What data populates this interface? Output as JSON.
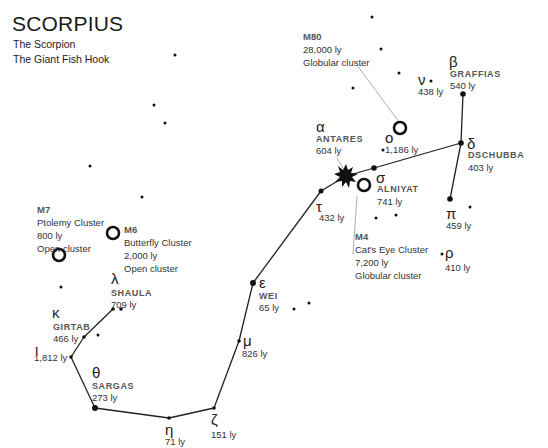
{
  "header": {
    "title": "SCORPIUS",
    "subtitle1": "The Scorpion",
    "subtitle2": "The Giant Fish Hook"
  },
  "stars": {
    "antares": {
      "greek": "α",
      "name": "ANTARES",
      "dist": "604 ly"
    },
    "graffias": {
      "greek": "β",
      "name": "GRAFFIAS",
      "dist": "540 ly"
    },
    "dschubba": {
      "greek": "δ",
      "name": "DSCHUBBA",
      "dist": "403 ly"
    },
    "alniyat": {
      "greek": "σ",
      "name": "ALNIYAT",
      "dist": "741 ly"
    },
    "pi": {
      "greek": "π",
      "dist": "459 ly"
    },
    "rho": {
      "greek": "ρ",
      "dist": "410 ly"
    },
    "nu": {
      "greek": "ν",
      "dist": "438 ly"
    },
    "omicron": {
      "greek": "ο",
      "dist": "1,186 ly"
    },
    "tau": {
      "greek": "τ",
      "dist": "432 ly"
    },
    "wei": {
      "greek": "ε",
      "name": "WEI",
      "dist": "65 ly"
    },
    "mu": {
      "greek": "μ",
      "dist": "826 ly"
    },
    "zeta": {
      "greek": "ζ",
      "dist": "151 ly"
    },
    "eta": {
      "greek": "η",
      "dist": "71 ly"
    },
    "sargas": {
      "greek": "θ",
      "name": "SARGAS",
      "dist": "273 ly"
    },
    "iota": {
      "greek": "ι",
      "dist": "1,812 ly"
    },
    "girtab": {
      "greek": "κ",
      "name": "GIRTAB",
      "dist": "466 ly"
    },
    "shaula": {
      "greek": "λ",
      "name": "SHAULA",
      "dist": "709 ly"
    }
  },
  "deep_sky": {
    "m80": {
      "id": "M80",
      "dist": "28,000 ly",
      "type": "Globular cluster"
    },
    "m4": {
      "id": "M4",
      "common": "Cat's Eye Cluster",
      "dist": "7,200 ly",
      "type": "Globular cluster"
    },
    "m7": {
      "id": "M7",
      "common": "Ptolemy Cluster",
      "dist": "800 ly",
      "type": "Open cluster"
    },
    "m6": {
      "id": "M6",
      "common": "Butterfly Cluster",
      "dist": "2,000 ly",
      "type": "Open cluster"
    }
  }
}
